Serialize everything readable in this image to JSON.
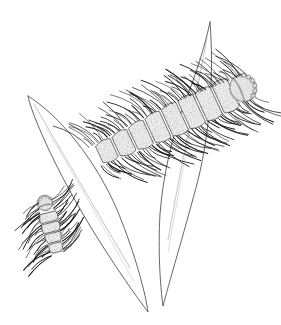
{
  "figure": {
    "medium": "pen-and-ink line drawing",
    "background_color": "#ffffff",
    "ink_color": "#1a1a1a",
    "stipple_color": "#7a7a7a",
    "leaf_edge_color": "#4a4a4a",
    "leaf_vein_color": "#9a9a9a",
    "canvas": {
      "width": 281,
      "height": 325
    }
  },
  "leaves": [
    {
      "name": "left-leaf",
      "tip": [
        28,
        96
      ],
      "base": [
        148,
        312
      ],
      "outline": "M28,96 C30,108 44,142 64,180 C86,222 118,272 148,312 C146,296 136,256 118,212 C96,160 60,116 28,96 Z",
      "veins": [
        "M34,104 C56,142 96,210 130,268",
        "M46,128 C70,168 104,228 134,282"
      ]
    },
    {
      "name": "right-leaf",
      "tip": [
        210,
        22
      ],
      "base": [
        163,
        306
      ],
      "outline": "M210,22 C205,46 196,74 185,102 C172,136 163,176 160,214 C158,250 160,284 163,306 C172,272 186,226 198,180 C210,132 214,72 210,22 Z",
      "veins": [
        "M207,38 C196,96 180,170 168,240",
        "M200,74 C190,130 178,196 168,252"
      ]
    }
  ],
  "larvae": [
    {
      "name": "primary-larva",
      "role": "large caterpillar, dorsolateral view",
      "orientation": "head upper-right, abdomen lower-left",
      "axis_start": [
        92,
        158
      ],
      "axis_end": [
        255,
        82
      ],
      "segment_count": 8,
      "head": {
        "position": [
          243,
          88
        ],
        "width": 26,
        "height": 28,
        "tubercle_count": 6
      },
      "setae": {
        "dorsal_count": 72,
        "ventral_count": 80,
        "length_range": [
          10,
          34
        ]
      },
      "texture": "stippled"
    },
    {
      "name": "secondary-larva",
      "role": "small caterpillar, lateral view",
      "orientation": "head upper, abdomen lower",
      "axis_start": [
        58,
        256
      ],
      "axis_end": [
        44,
        200
      ],
      "segment_count": 4,
      "head": {
        "position": [
          45,
          203
        ],
        "width": 15,
        "height": 15,
        "tubercle_count": 4
      },
      "setae": {
        "dorsal_count": 34,
        "ventral_count": 30,
        "length_range": [
          9,
          28
        ]
      },
      "texture": "stippled"
    }
  ]
}
